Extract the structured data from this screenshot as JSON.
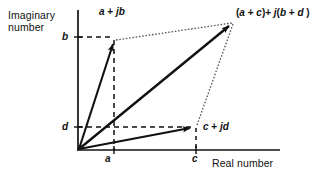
{
  "figure": {
    "type": "argand-diagram",
    "background_color": "#ffffff",
    "stroke_color": "#111111"
  },
  "axes": {
    "imaginary": {
      "title": "Imaginary number",
      "title_line_1": "Imaginary",
      "title_line_2": "number",
      "orientation": "vertical"
    },
    "real": {
      "title": "Real number",
      "orientation": "horizontal"
    },
    "origin_px": [
      78,
      150
    ],
    "x_axis_px": {
      "x1": 78,
      "x2": 280,
      "y": 150
    },
    "y_axis_px": {
      "y1": 10,
      "y2": 150,
      "x": 78
    }
  },
  "ticks": {
    "imaginary": [
      {
        "label": "b",
        "y_px": 37
      },
      {
        "label": "d",
        "y_px": 127
      }
    ],
    "real": [
      {
        "label": "a",
        "x_px": 114
      },
      {
        "label": "c",
        "x_px": 196
      }
    ]
  },
  "vectors": [
    {
      "name": "first-complex-number",
      "label": "a + jb",
      "label_parts": {
        "re": "a",
        "op": " + ",
        "j": "j",
        "im": "b"
      },
      "tip_px": [
        114,
        40
      ],
      "style": "solid-arrow"
    },
    {
      "name": "second-complex-number",
      "label": "c + jd",
      "label_parts": {
        "re": "c",
        "op": " + ",
        "j": "j",
        "im": "d"
      },
      "tip_px": [
        196,
        127
      ],
      "style": "solid-arrow"
    },
    {
      "name": "sum-complex-number",
      "label": "(a + c)+ j(b + d )",
      "label_parts": {
        "open": "(",
        "re1": "a",
        "op1": " + ",
        "re2": "c",
        "close1": ")+ ",
        "j": "j",
        "open2": "(",
        "im1": "b",
        "op2": " + ",
        "im2": "d",
        "close2": " )"
      },
      "tip_px": [
        233,
        22
      ],
      "style": "solid-arrow"
    }
  ],
  "construction_lines": {
    "dashed_projections": [
      {
        "name": "b-projection",
        "from_px": [
          78,
          37
        ],
        "to_px": [
          114,
          37
        ]
      },
      {
        "name": "a-projection",
        "from_px": [
          114,
          37
        ],
        "to_px": [
          114,
          150
        ]
      },
      {
        "name": "d-projection",
        "from_px": [
          78,
          127
        ],
        "to_px": [
          196,
          127
        ]
      },
      {
        "name": "c-projection",
        "from_px": [
          196,
          127
        ],
        "to_px": [
          196,
          150
        ]
      }
    ],
    "dotted_parallelogram": [
      {
        "name": "parallel-side-top",
        "from_px": [
          114,
          40
        ],
        "to_px": [
          233,
          22
        ]
      },
      {
        "name": "parallel-side-right",
        "from_px": [
          196,
          127
        ],
        "to_px": [
          233,
          22
        ]
      }
    ]
  }
}
